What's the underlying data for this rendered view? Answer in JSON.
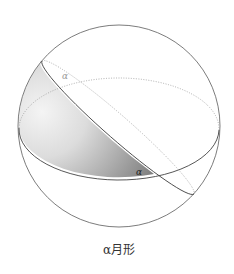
{
  "figure": {
    "caption": "α月形",
    "labels": {
      "front_angle": "α",
      "back_angle": "α"
    },
    "colors": {
      "outline": "#555555",
      "hidden_line": "#9a9a9a",
      "shade_light": "#f2f2f2",
      "shade_dark": "#7f7f7f",
      "front_label": "#222222",
      "back_label": "#999999"
    }
  }
}
